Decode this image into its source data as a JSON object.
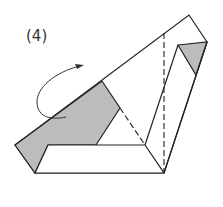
{
  "step": {
    "label": "(4)"
  },
  "colors": {
    "stroke": "#222222",
    "shade": "#bcbcbc",
    "paper": "#ffffff"
  },
  "diagram": {
    "type": "origami-fold-instruction",
    "elements": [
      "outer-paper-outline",
      "shaded-left-flap",
      "shaded-right-triangle",
      "bottom-strip",
      "right-strip",
      "valley-fold-dashed-line-vertical",
      "valley-fold-dashed-line-diagonal",
      "curved-fold-arrow"
    ]
  }
}
